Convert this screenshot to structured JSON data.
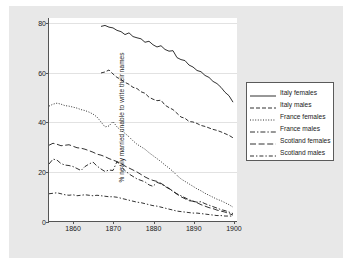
{
  "chart_data": {
    "type": "line",
    "title": "",
    "xlabel": "",
    "ylabel": "% newly married unable to write their names",
    "xlim": [
      1854,
      1901
    ],
    "ylim": [
      0,
      82
    ],
    "grid": true,
    "legend_position": "right",
    "xticks": [
      "1860",
      "1870",
      "1880",
      "1890",
      "1900"
    ],
    "xtick_values": [
      1860,
      1870,
      1880,
      1890,
      1900
    ],
    "yticks": [
      "0",
      "20",
      "40",
      "60",
      "80"
    ],
    "ytick_values": [
      0,
      20,
      40,
      60,
      80
    ],
    "series": [
      {
        "name": "Italy females",
        "style": "solid",
        "x": [
          1867,
          1868,
          1869,
          1870,
          1871,
          1872,
          1873,
          1874,
          1875,
          1876,
          1877,
          1878,
          1879,
          1880,
          1881,
          1882,
          1883,
          1884,
          1885,
          1886,
          1887,
          1888,
          1889,
          1890,
          1891,
          1892,
          1893,
          1894,
          1895,
          1896,
          1897,
          1898,
          1899,
          1900
        ],
        "values": [
          78.6,
          79.0,
          78.3,
          78.0,
          77.0,
          76.5,
          75.3,
          76.0,
          74.5,
          74.0,
          73.6,
          72.2,
          72.6,
          71.2,
          70.3,
          70.8,
          69.3,
          68.6,
          68.8,
          66.0,
          65.2,
          64.8,
          63.0,
          62.2,
          60.8,
          60.3,
          58.8,
          58.0,
          56.4,
          55.5,
          54.0,
          52.0,
          50.6,
          48.0
        ]
      },
      {
        "name": "Italy males",
        "style": "dashed",
        "x": [
          1867,
          1868,
          1869,
          1870,
          1871,
          1872,
          1873,
          1874,
          1875,
          1876,
          1877,
          1878,
          1879,
          1880,
          1881,
          1882,
          1883,
          1884,
          1885,
          1886,
          1887,
          1888,
          1889,
          1890,
          1891,
          1892,
          1893,
          1894,
          1895,
          1896,
          1897,
          1898,
          1899,
          1900
        ],
        "values": [
          59.8,
          60.2,
          61.0,
          59.4,
          58.0,
          57.2,
          56.0,
          55.2,
          54.0,
          53.5,
          52.2,
          51.6,
          50.0,
          49.2,
          48.6,
          48.8,
          46.8,
          45.8,
          45.0,
          43.5,
          42.0,
          41.5,
          40.2,
          40.0,
          39.4,
          38.6,
          38.2,
          37.6,
          37.0,
          36.6,
          36.0,
          35.3,
          34.6,
          33.6
        ]
      },
      {
        "name": "France females",
        "style": "dotted",
        "x": [
          1854,
          1855,
          1856,
          1857,
          1858,
          1859,
          1860,
          1861,
          1862,
          1863,
          1864,
          1865,
          1866,
          1867,
          1868,
          1869,
          1870,
          1871,
          1872,
          1873,
          1874,
          1875,
          1876,
          1877,
          1878,
          1879,
          1880,
          1881,
          1882,
          1883,
          1884,
          1885,
          1886,
          1887,
          1888,
          1889,
          1890,
          1891,
          1892,
          1893,
          1894,
          1895,
          1896,
          1897,
          1898,
          1899,
          1900
        ],
        "values": [
          46.4,
          47.2,
          47.6,
          47.2,
          46.6,
          46.4,
          46.0,
          45.6,
          45.0,
          44.6,
          44.0,
          43.2,
          42.0,
          40.0,
          38.0,
          38.4,
          40.2,
          38.0,
          36.6,
          35.4,
          34.0,
          32.4,
          31.0,
          30.0,
          29.0,
          27.6,
          26.4,
          25.2,
          24.0,
          22.6,
          21.4,
          20.0,
          18.4,
          17.0,
          16.0,
          15.0,
          14.0,
          13.0,
          12.2,
          11.2,
          10.4,
          9.6,
          8.8,
          8.2,
          7.4,
          6.6,
          5.6
        ]
      },
      {
        "name": "France males",
        "style": "dashdot",
        "x": [
          1854,
          1855,
          1856,
          1857,
          1858,
          1859,
          1860,
          1861,
          1862,
          1863,
          1864,
          1865,
          1866,
          1867,
          1868,
          1869,
          1870,
          1871,
          1872,
          1873,
          1874,
          1875,
          1876,
          1877,
          1878,
          1879,
          1880,
          1881,
          1882,
          1883,
          1884,
          1885,
          1886,
          1887,
          1888,
          1889,
          1890,
          1891,
          1892,
          1893,
          1894,
          1895,
          1896,
          1897,
          1898,
          1899,
          1900
        ],
        "values": [
          23.0,
          25.0,
          24.6,
          23.2,
          22.6,
          22.4,
          22.0,
          21.2,
          20.4,
          22.0,
          23.0,
          23.8,
          22.2,
          21.0,
          20.0,
          20.6,
          20.4,
          24.0,
          22.0,
          20.4,
          19.0,
          18.0,
          17.0,
          16.4,
          15.8,
          14.6,
          14.0,
          15.6,
          15.0,
          14.0,
          13.0,
          12.0,
          11.0,
          10.2,
          9.4,
          8.6,
          8.0,
          7.6,
          7.8,
          7.0,
          6.4,
          5.8,
          5.2,
          4.6,
          4.2,
          3.6,
          3.0
        ]
      },
      {
        "name": "Scotland females",
        "style": "longdash",
        "x": [
          1854,
          1855,
          1856,
          1857,
          1858,
          1859,
          1860,
          1861,
          1862,
          1863,
          1864,
          1865,
          1866,
          1867,
          1868,
          1869,
          1870,
          1871,
          1872,
          1873,
          1874,
          1875,
          1876,
          1877,
          1878,
          1879,
          1880,
          1881,
          1882,
          1883,
          1884,
          1885,
          1886,
          1887,
          1888,
          1889,
          1890,
          1891,
          1892,
          1893,
          1894,
          1895,
          1896,
          1897,
          1898,
          1899,
          1900
        ],
        "values": [
          30.6,
          31.4,
          31.0,
          30.4,
          30.6,
          30.8,
          30.2,
          29.6,
          29.4,
          29.0,
          28.4,
          27.8,
          27.0,
          26.6,
          26.0,
          25.2,
          24.6,
          24.0,
          23.2,
          22.2,
          21.4,
          20.6,
          19.8,
          18.8,
          17.8,
          17.0,
          16.4,
          16.0,
          15.2,
          14.2,
          13.2,
          12.0,
          10.8,
          9.8,
          9.0,
          8.2,
          8.0,
          7.4,
          6.6,
          6.0,
          5.4,
          5.0,
          4.4,
          4.0,
          3.6,
          3.0,
          2.4
        ]
      },
      {
        "name": "Scotland males",
        "style": "dashdotdash",
        "x": [
          1854,
          1855,
          1856,
          1857,
          1858,
          1859,
          1860,
          1861,
          1862,
          1863,
          1864,
          1865,
          1866,
          1867,
          1868,
          1869,
          1870,
          1871,
          1872,
          1873,
          1874,
          1875,
          1876,
          1877,
          1878,
          1879,
          1880,
          1881,
          1882,
          1883,
          1884,
          1885,
          1886,
          1887,
          1888,
          1889,
          1890,
          1891,
          1892,
          1893,
          1894,
          1895,
          1896,
          1897,
          1898,
          1899,
          1900
        ],
        "values": [
          11.0,
          11.2,
          11.4,
          11.0,
          10.6,
          10.4,
          10.6,
          10.2,
          10.4,
          10.6,
          10.4,
          10.2,
          10.4,
          10.2,
          10.0,
          9.8,
          9.8,
          9.6,
          9.2,
          8.8,
          8.4,
          8.0,
          7.6,
          7.4,
          7.0,
          6.6,
          6.2,
          6.0,
          5.6,
          5.2,
          4.8,
          4.4,
          4.0,
          3.8,
          3.6,
          3.4,
          3.2,
          3.2,
          3.0,
          2.8,
          2.6,
          2.4,
          2.2,
          2.2,
          2.0,
          2.0,
          2.0
        ]
      }
    ]
  },
  "legend": {
    "entries": [
      {
        "label": "Italy females"
      },
      {
        "label": "Italy males"
      },
      {
        "label": "France females"
      },
      {
        "label": "France males"
      },
      {
        "label": "Scotland females"
      },
      {
        "label": "Scotland males"
      }
    ]
  },
  "colors": {
    "series_line": "#1a1a1a",
    "axis": "#555555",
    "gridline": "#e2e2e2",
    "plot_background": "#ffffff",
    "figure_background": "#e8e8e8",
    "page_background": "#ffffff"
  }
}
